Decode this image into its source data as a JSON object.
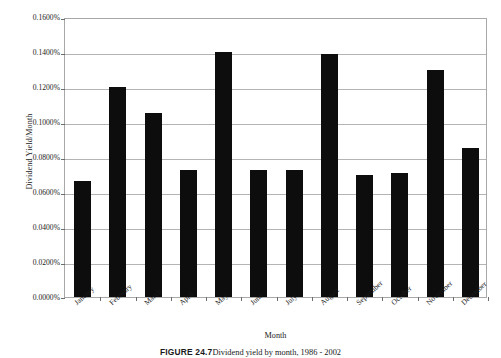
{
  "chart_data": {
    "type": "bar",
    "title": "",
    "xlabel": "Month",
    "ylabel": "Dividend Yield/Month",
    "categories": [
      "January",
      "February",
      "March",
      "April",
      "May",
      "June",
      "July",
      "August",
      "September",
      "October",
      "November",
      "December"
    ],
    "values": [
      0.000665,
      0.0012,
      0.00105,
      0.000725,
      0.0014,
      0.000725,
      0.000725,
      0.00139,
      0.0007,
      0.00071,
      0.0013,
      0.00085
    ],
    "value_labels": [
      "0.0665%",
      "0.1200%",
      "0.1050%",
      "0.0725%",
      "0.1400%",
      "0.0725%",
      "0.0725%",
      "0.1390%",
      "0.0700%",
      "0.0710%",
      "0.1300%",
      "0.0850%"
    ],
    "ylim": [
      0,
      0.0016
    ],
    "ytick_values": [
      0.0016,
      0.0014,
      0.0012,
      0.001,
      0.0008,
      0.0006,
      0.0004,
      0.0002,
      0
    ],
    "ytick_labels": [
      "0.1600%",
      "0.1400%",
      "0.1200%",
      "0.1000%",
      "0.0800%",
      "0.0600%",
      "0.0400%",
      "0.0200%",
      "0.0000%"
    ],
    "grid": true,
    "legend": "none",
    "series_color": "#0d0d0d",
    "grid_color": "#b4b4b4",
    "frame_color": "#a8a8a8"
  },
  "caption": {
    "label": "FIGURE 24.7",
    "text": "Dividend yield by month, 1986 - 2002"
  }
}
